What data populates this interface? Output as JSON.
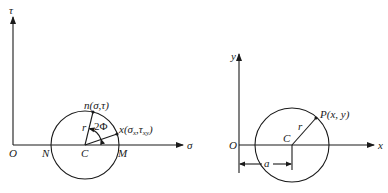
{
  "mohr_circle": {
    "vertical_axis_label": "τ",
    "horizontal_axis_label": "σ",
    "origin_label": "O",
    "left_intersection_label": "N",
    "center_label": "C",
    "right_intersection_label": "M",
    "radius_label": "r",
    "angle_label": "2Φ",
    "point_n_label": "n(σ,τ)",
    "point_x_label_main": "x(σ",
    "point_x_sub1": "x",
    "point_x_mid": ",τ",
    "point_x_sub2": "xy",
    "point_x_close": ")"
  },
  "circle_plot": {
    "vertical_axis_label": "y",
    "horizontal_axis_label": "x",
    "origin_label": "O",
    "center_label": "C",
    "radius_label": "r",
    "point_label": "P(x, y)",
    "offset_label": "a"
  }
}
